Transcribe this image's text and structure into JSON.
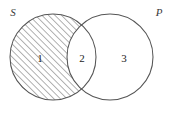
{
  "figure": {
    "background_color": "#ffffff",
    "stroke_color": "#555555",
    "hatch_color": "#4a4a4a",
    "label_color": "#1c1c1c"
  },
  "sets": {
    "left": {
      "name": "left-set",
      "label": "S",
      "shaded": true,
      "center_x": 53,
      "center_y": 57,
      "radius": 43
    },
    "right": {
      "name": "right-set",
      "label": "P",
      "shaded": false,
      "center_x": 110,
      "center_y": 57,
      "radius": 43
    }
  },
  "regions": [
    {
      "id": "region-1",
      "label": "1",
      "description": "S only (shaded with diagonal hatching)",
      "shaded": true,
      "x": 40,
      "y": 58
    },
    {
      "id": "region-2",
      "label": "2",
      "description": "S intersect P (unshaded)",
      "shaded": false,
      "x": 82,
      "y": 58
    },
    {
      "id": "region-3",
      "label": "3",
      "description": "P only (unshaded)",
      "shaded": false,
      "x": 124,
      "y": 58
    }
  ],
  "hatching": {
    "name": "diagonal-hatch-pattern",
    "direction": "lower-left to upper-right",
    "angle_degrees": 45,
    "spacing_px": 4.6,
    "line_width_px": 0.85,
    "color": "#4a4a4a"
  },
  "labels": {
    "set_s": "S",
    "set_p": "P",
    "region_one": "1",
    "region_two": "2",
    "region_three": "3"
  }
}
